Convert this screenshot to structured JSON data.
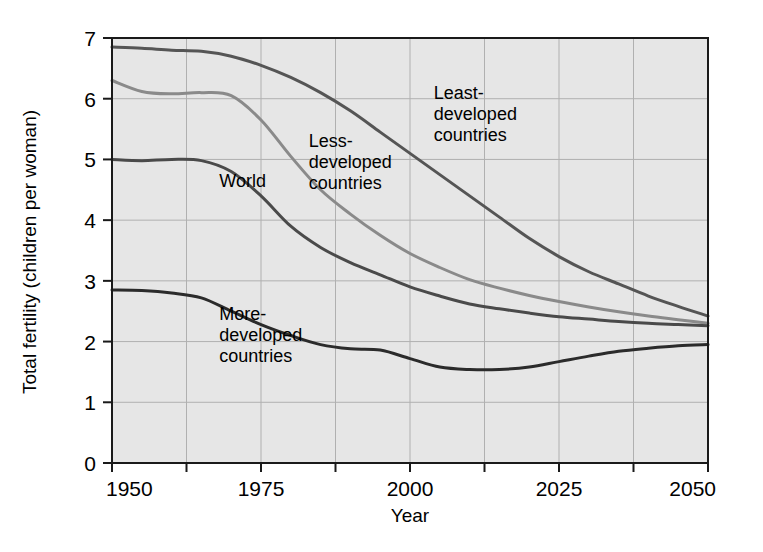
{
  "chart_data": {
    "type": "line",
    "title": "",
    "xlabel": "Year",
    "ylabel": "Total fertility (children per woman)",
    "xlim": [
      1950,
      2050
    ],
    "ylim": [
      0,
      7
    ],
    "xticks": [
      1950,
      1975,
      2000,
      2025,
      2050
    ],
    "xtick_labels": [
      "1950",
      "1975",
      "2000",
      "2025",
      "2050"
    ],
    "xminor_ticks": [
      1962.5,
      1987.5,
      2012.5,
      2037.5
    ],
    "yticks": [
      0,
      1,
      2,
      3,
      4,
      5,
      6,
      7
    ],
    "ytick_labels": [
      "0",
      "1",
      "2",
      "3",
      "4",
      "5",
      "6",
      "7"
    ],
    "grid": true,
    "legend": "inline-annotations",
    "plot_background": "#e6e6e6",
    "grid_color": "#b0b0b0",
    "axis_color": "#1a1a1a",
    "x": [
      1950,
      1955,
      1960,
      1965,
      1970,
      1975,
      1980,
      1985,
      1990,
      1995,
      2000,
      2005,
      2010,
      2015,
      2020,
      2025,
      2030,
      2035,
      2040,
      2045,
      2050
    ],
    "series": [
      {
        "name": "Least-developed countries",
        "color": "#555555",
        "label_text": "Least-\ndeveloped\ncountries",
        "label_x": 2004,
        "label_y": 6.0,
        "values": [
          6.85,
          6.83,
          6.8,
          6.78,
          6.7,
          6.55,
          6.35,
          6.1,
          5.8,
          5.45,
          5.1,
          4.75,
          4.4,
          4.05,
          3.7,
          3.4,
          3.15,
          2.95,
          2.75,
          2.58,
          2.42
        ]
      },
      {
        "name": "Less-developed countries",
        "color": "#8a8a8a",
        "label_text": "Less-\ndeveloped\ncountries",
        "label_x": 1983,
        "label_y": 5.2,
        "values": [
          6.3,
          6.12,
          6.08,
          6.1,
          6.05,
          5.65,
          5.05,
          4.5,
          4.1,
          3.75,
          3.45,
          3.22,
          3.02,
          2.88,
          2.76,
          2.66,
          2.57,
          2.49,
          2.42,
          2.36,
          2.3
        ]
      },
      {
        "name": "World",
        "color": "#4a4a4a",
        "label_text": "World",
        "label_x": 1968,
        "label_y": 4.55,
        "values": [
          5.0,
          4.98,
          5.0,
          4.98,
          4.8,
          4.4,
          3.9,
          3.55,
          3.3,
          3.1,
          2.9,
          2.75,
          2.62,
          2.54,
          2.47,
          2.41,
          2.37,
          2.33,
          2.3,
          2.28,
          2.26
        ]
      },
      {
        "name": "More-developed countries",
        "color": "#2b2b2b",
        "label_text": "More-\ndeveloped\ncountries",
        "label_x": 1968,
        "label_y": 2.35,
        "values": [
          2.85,
          2.84,
          2.8,
          2.72,
          2.5,
          2.28,
          2.1,
          1.95,
          1.88,
          1.86,
          1.72,
          1.58,
          1.54,
          1.54,
          1.58,
          1.67,
          1.76,
          1.84,
          1.89,
          1.93,
          1.95
        ]
      }
    ]
  },
  "axis": {
    "y_title": "Total fertility (children per woman)",
    "x_title": "Year"
  }
}
